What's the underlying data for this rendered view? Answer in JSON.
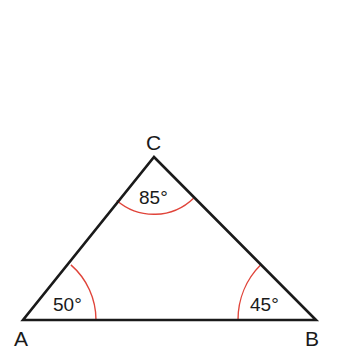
{
  "diagram": {
    "type": "triangle",
    "colors": {
      "edge": "#1a1a1a",
      "arc": "#e0443a",
      "background": "#ffffff"
    },
    "vertices": [
      {
        "name": "A",
        "x": 23,
        "y": 320,
        "label_x": 14,
        "label_y": 346
      },
      {
        "name": "B",
        "x": 316,
        "y": 320,
        "label_x": 305,
        "label_y": 346
      },
      {
        "name": "C",
        "x": 154,
        "y": 157,
        "label_x": 146,
        "label_y": 150
      }
    ],
    "angles": [
      {
        "vertex": "A",
        "value": "50°",
        "label_x": 53,
        "label_y": 311
      },
      {
        "vertex": "B",
        "value": "45°",
        "label_x": 250,
        "label_y": 311
      },
      {
        "vertex": "C",
        "value": "85°",
        "label_x": 139,
        "label_y": 204
      }
    ]
  }
}
